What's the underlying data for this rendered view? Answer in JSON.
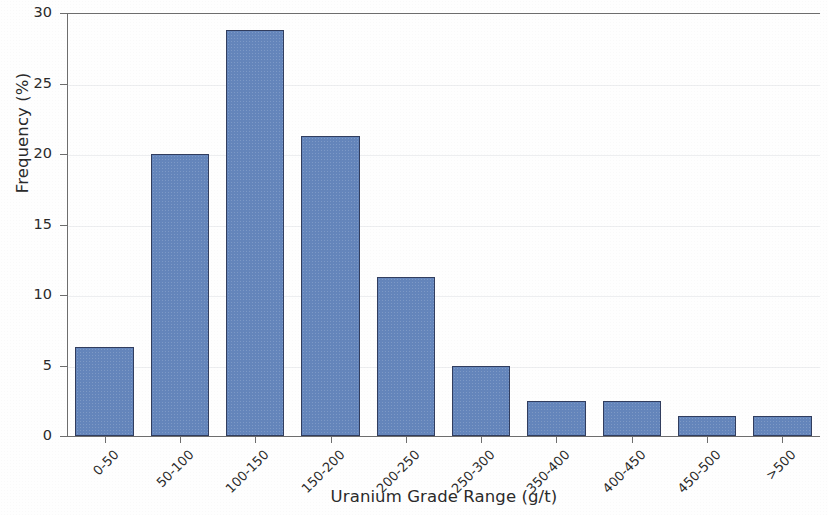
{
  "chart_data": {
    "type": "bar",
    "title": "",
    "xlabel": "Uranium Grade Range (g/t)",
    "ylabel": "Frequency (%)",
    "categories": [
      "0-50",
      "50-100",
      "100-150",
      "150-200",
      "200-250",
      "250-300",
      "350-400",
      "400-450",
      "450-500",
      ">500"
    ],
    "values": [
      6.3,
      20.0,
      28.8,
      21.3,
      11.3,
      5.0,
      2.5,
      2.5,
      1.4,
      1.4
    ],
    "ylim": [
      0,
      30
    ],
    "yticks": [
      0,
      5,
      10,
      15,
      20,
      25,
      30
    ],
    "ytick_labels": [
      "0",
      "5",
      "10",
      "15",
      "20",
      "25",
      "30"
    ],
    "grid": false,
    "legend": null,
    "bar_color": "#6485bb",
    "bar_edge_color": "#313d5e",
    "axis_color": "#6d6d6d",
    "background_color": "#ffffff",
    "xtick_rotation": -45
  }
}
